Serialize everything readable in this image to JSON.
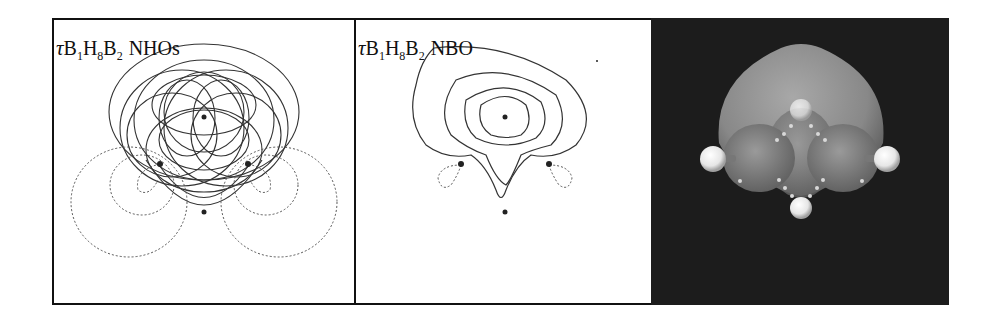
{
  "figure": {
    "panels": [
      {
        "id": "nho",
        "label": {
          "tau": "τ",
          "b1": "B",
          "b1_sub": "1",
          "h": "H",
          "h_sub": "8",
          "b2": "B",
          "b2_sub": "2",
          "kind": "NHOs"
        },
        "type": "contour-plot",
        "line_styles": [
          "solid-positive",
          "dotted-negative"
        ]
      },
      {
        "id": "nbo",
        "label": {
          "tau": "τ",
          "b1": "B",
          "b1_sub": "1",
          "h": "H",
          "h_sub": "8",
          "b2": "B",
          "b2_sub": "2",
          "kind": "NBO"
        },
        "type": "contour-plot",
        "line_styles": [
          "solid-positive",
          "dotted-negative"
        ]
      },
      {
        "id": "surface",
        "type": "3d-orbital-surface",
        "background": "#1c1c1c"
      }
    ],
    "colors": {
      "line": "#333333",
      "border": "#111111",
      "dark_bg": "#1c1c1c",
      "surface": "#8a8a8a",
      "atom": "#f2f2f2"
    }
  }
}
